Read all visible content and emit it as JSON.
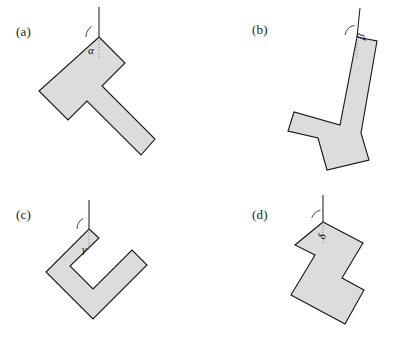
{
  "figure": {
    "background_color": "#ffffff",
    "shape_fill_color": "#dcdcdc",
    "shape_stroke_color": "#151515",
    "width": 400,
    "height": 354
  },
  "panels": [
    {
      "id": "a",
      "label": "(a)",
      "label_pos": [
        16,
        24
      ],
      "angle_symbol": "α",
      "angle_label_pos": [
        88,
        44
      ],
      "shape_name": "t-shape-hammer",
      "pivot": [
        99,
        37
      ],
      "ref_line": {
        "x1": 99,
        "y1": 7,
        "x2": 99,
        "y2": 37
      },
      "arc": {
        "cx": 99,
        "cy": 37,
        "r": 13,
        "start_deg": 180,
        "end_deg": 235
      },
      "points": [
        [
          99,
          37
        ],
        [
          125,
          63
        ],
        [
          102,
          86
        ],
        [
          155,
          139
        ],
        [
          141,
          155
        ],
        [
          87,
          101
        ],
        [
          68,
          120
        ],
        [
          39,
          91
        ]
      ]
    },
    {
      "id": "b",
      "label": "(b)",
      "label_pos": [
        252,
        22
      ],
      "angle_symbol": "β",
      "angle_label_pos": [
        354,
        38
      ],
      "shape_name": "t-shape-hammer",
      "pivot": [
        357,
        37
      ],
      "ref_line": {
        "x1": 360,
        "y1": 8,
        "x2": 357,
        "y2": 37
      },
      "arc": {
        "cx": 357,
        "cy": 37,
        "r": 12,
        "start_deg": 190,
        "end_deg": 258
      },
      "points": [
        [
          357,
          37
        ],
        [
          377,
          41
        ],
        [
          361,
          133
        ],
        [
          369,
          160
        ],
        [
          327,
          170
        ],
        [
          318,
          138
        ],
        [
          288,
          131
        ],
        [
          294,
          112
        ],
        [
          340,
          125
        ]
      ]
    },
    {
      "id": "c",
      "label": "(c)",
      "label_pos": [
        16,
        207
      ],
      "angle_symbol": "γ",
      "angle_label_pos": [
        82,
        243
      ],
      "shape_name": "c-shape-bracket",
      "pivot": [
        89,
        229
      ],
      "ref_line": {
        "x1": 89,
        "y1": 200,
        "x2": 89,
        "y2": 229
      },
      "arc": {
        "cx": 89,
        "cy": 229,
        "r": 12,
        "start_deg": 180,
        "end_deg": 240
      },
      "points": [
        [
          89,
          229
        ],
        [
          99,
          238
        ],
        [
          70,
          266
        ],
        [
          93,
          289
        ],
        [
          132,
          250
        ],
        [
          147,
          265
        ],
        [
          93,
          319
        ],
        [
          46,
          272
        ]
      ]
    },
    {
      "id": "d",
      "label": "(d)",
      "label_pos": [
        252,
        207
      ],
      "angle_symbol": "δ",
      "angle_label_pos": [
        315,
        237
      ],
      "shape_name": "c-shape-bracket",
      "pivot": [
        323,
        222
      ],
      "ref_line": {
        "x1": 323,
        "y1": 195,
        "x2": 323,
        "y2": 222
      },
      "arc": {
        "cx": 323,
        "cy": 222,
        "r": 12,
        "start_deg": 200,
        "end_deg": 258
      },
      "points": [
        [
          323,
          222
        ],
        [
          363,
          243
        ],
        [
          342,
          278
        ],
        [
          364,
          290
        ],
        [
          345,
          324
        ],
        [
          291,
          295
        ],
        [
          315,
          255
        ],
        [
          295,
          245
        ]
      ]
    }
  ]
}
